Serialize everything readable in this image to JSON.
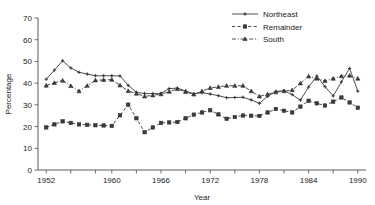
{
  "chart_data": {
    "type": "line",
    "title": "",
    "xlabel": "Year",
    "ylabel": "Percentage",
    "xlim": [
      1951,
      1991
    ],
    "ylim": [
      0,
      70
    ],
    "grid": false,
    "legend_position": "top-right",
    "y_ticks": [
      0,
      10,
      20,
      30,
      40,
      50,
      60,
      70
    ],
    "y_tick_labels": [
      "0",
      "10",
      "20",
      "30",
      "40",
      "50",
      "60",
      "70"
    ],
    "x_ticks": [
      1952,
      1955,
      1958,
      1960,
      1963,
      1966,
      1969,
      1972,
      1975,
      1978,
      1981,
      1984,
      1987,
      1990
    ],
    "x_tick_labels": [
      "1952",
      "1960",
      "1966",
      "1972",
      "1978",
      "1984",
      "1990"
    ],
    "x_labeled_ticks": [
      1952,
      1960,
      1966,
      1972,
      1978,
      1984,
      1990
    ],
    "x": [
      1952,
      1953,
      1954,
      1955,
      1956,
      1957,
      1958,
      1959,
      1960,
      1961,
      1962,
      1963,
      1964,
      1965,
      1966,
      1967,
      1968,
      1969,
      1970,
      1971,
      1972,
      1973,
      1974,
      1975,
      1976,
      1977,
      1978,
      1979,
      1980,
      1981,
      1982,
      1983,
      1984,
      1985,
      1986,
      1987,
      1988,
      1989,
      1990
    ],
    "series": [
      {
        "name": "Northeast",
        "marker": "plus",
        "linestyle": "solid",
        "values": [
          41.8,
          46.0,
          50.3,
          47.0,
          45.0,
          44.2,
          43.4,
          43.4,
          43.4,
          43.3,
          39.0,
          35.8,
          35.2,
          35.2,
          35.3,
          37.5,
          37.7,
          36.4,
          35.1,
          35.6,
          35.0,
          34.2,
          33.3,
          33.4,
          33.5,
          32.3,
          30.7,
          33.9,
          36.2,
          36.5,
          34.7,
          32.2,
          38.2,
          43.3,
          38.4,
          34.1,
          40.6,
          46.8,
          36.3
        ]
      },
      {
        "name": "Remainder",
        "marker": "square",
        "linestyle": "dashed",
        "values": [
          19.6,
          21.0,
          22.4,
          21.7,
          21.0,
          20.8,
          20.6,
          20.5,
          20.3,
          25.2,
          30.1,
          23.8,
          17.4,
          19.6,
          21.7,
          21.9,
          22.1,
          23.8,
          25.5,
          26.5,
          27.5,
          25.6,
          23.6,
          24.4,
          25.1,
          25.0,
          24.9,
          26.5,
          28.1,
          27.3,
          26.5,
          29.2,
          31.9,
          30.7,
          29.7,
          31.5,
          33.4,
          31.1,
          28.7
        ]
      },
      {
        "name": "South",
        "marker": "triangle",
        "linestyle": "dashdot",
        "values": [
          38.9,
          40.1,
          41.2,
          38.7,
          36.3,
          38.8,
          41.3,
          41.5,
          41.6,
          39.0,
          36.4,
          35.2,
          33.9,
          34.4,
          34.9,
          36.1,
          37.3,
          36.0,
          34.8,
          36.3,
          37.8,
          38.3,
          38.8,
          38.8,
          38.8,
          36.3,
          33.9,
          34.9,
          35.8,
          36.3,
          36.8,
          39.9,
          43.1,
          42.1,
          41.0,
          42.1,
          43.2,
          43.5,
          42.1
        ]
      }
    ],
    "legend": [
      "Northeast",
      "Remainder",
      "South"
    ]
  },
  "colors": {
    "line": "#3a3a3a",
    "axis": "#4a4a4a",
    "text": "#1a1a1a",
    "background": "#ffffff"
  }
}
